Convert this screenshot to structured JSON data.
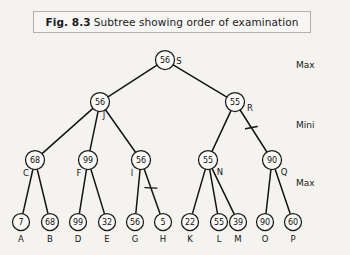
{
  "figure": {
    "number": "Fig. 8.3",
    "caption": "Subtree showing order of examination",
    "border_color": "#b3b0ab",
    "background_color": "#f4f3f0"
  },
  "level_labels": [
    {
      "text": "Max",
      "x": 296,
      "y": 68
    },
    {
      "text": "Mini",
      "x": 296,
      "y": 128
    },
    {
      "text": "Max",
      "x": 296,
      "y": 186
    }
  ],
  "chart_data": {
    "type": "diagram",
    "levels": [
      "Max",
      "Mini",
      "Max",
      "Leaves"
    ],
    "nodes": [
      {
        "id": "S",
        "value": "56",
        "tag": "S",
        "level": 0,
        "x": 165,
        "y": 60,
        "tag_dx": 14,
        "tag_dy": 4
      },
      {
        "id": "J",
        "value": "56",
        "tag": "J",
        "level": 1,
        "x": 100,
        "y": 102,
        "tag_dx": 4,
        "tag_dy": 16
      },
      {
        "id": "R",
        "value": "55",
        "tag": "R",
        "level": 1,
        "x": 235,
        "y": 102,
        "tag_dx": 15,
        "tag_dy": 9
      },
      {
        "id": "C",
        "value": "68",
        "tag": "C",
        "level": 2,
        "x": 35,
        "y": 160,
        "tag_dx": -9,
        "tag_dy": 16
      },
      {
        "id": "F",
        "value": "99",
        "tag": "F",
        "level": 2,
        "x": 88,
        "y": 160,
        "tag_dx": -9,
        "tag_dy": 16
      },
      {
        "id": "I",
        "value": "56",
        "tag": "I",
        "level": 2,
        "x": 141,
        "y": 160,
        "tag_dx": -9,
        "tag_dy": 16
      },
      {
        "id": "N",
        "value": "55",
        "tag": "N",
        "level": 2,
        "x": 208,
        "y": 160,
        "tag_dx": 12,
        "tag_dy": 15
      },
      {
        "id": "Q",
        "value": "90",
        "tag": "Q",
        "level": 2,
        "x": 272,
        "y": 160,
        "tag_dx": 12,
        "tag_dy": 15
      },
      {
        "id": "A",
        "value": "7",
        "tag": "A",
        "level": 3,
        "x": 21,
        "y": 222,
        "tag_dx": 0,
        "tag_dy": 20
      },
      {
        "id": "B",
        "value": "68",
        "tag": "B",
        "level": 3,
        "x": 50,
        "y": 222,
        "tag_dx": 0,
        "tag_dy": 20
      },
      {
        "id": "D",
        "value": "99",
        "tag": "D",
        "level": 3,
        "x": 78,
        "y": 222,
        "tag_dx": 0,
        "tag_dy": 20
      },
      {
        "id": "E",
        "value": "32",
        "tag": "E",
        "level": 3,
        "x": 107,
        "y": 222,
        "tag_dx": 0,
        "tag_dy": 20
      },
      {
        "id": "G",
        "value": "56",
        "tag": "G",
        "level": 3,
        "x": 135,
        "y": 222,
        "tag_dx": 0,
        "tag_dy": 20
      },
      {
        "id": "H",
        "value": "5",
        "tag": "H",
        "level": 3,
        "x": 163,
        "y": 222,
        "tag_dx": 0,
        "tag_dy": 20
      },
      {
        "id": "K",
        "value": "22",
        "tag": "K",
        "level": 3,
        "x": 190,
        "y": 222,
        "tag_dx": 0,
        "tag_dy": 20
      },
      {
        "id": "L",
        "value": "55",
        "tag": "L",
        "level": 3,
        "x": 219,
        "y": 222,
        "tag_dx": 0,
        "tag_dy": 20
      },
      {
        "id": "M",
        "value": "39",
        "tag": "M",
        "level": 3,
        "x": 238,
        "y": 222,
        "tag_dx": 0,
        "tag_dy": 20
      },
      {
        "id": "O",
        "value": "90",
        "tag": "O",
        "level": 3,
        "x": 265,
        "y": 222,
        "tag_dx": 0,
        "tag_dy": 20
      },
      {
        "id": "P",
        "value": "60",
        "tag": "P",
        "level": 3,
        "x": 293,
        "y": 222,
        "tag_dx": 0,
        "tag_dy": 20
      }
    ],
    "edges": [
      {
        "from": "S",
        "to": "J",
        "cut": false
      },
      {
        "from": "S",
        "to": "R",
        "cut": false
      },
      {
        "from": "J",
        "to": "C",
        "cut": false
      },
      {
        "from": "J",
        "to": "F",
        "cut": false
      },
      {
        "from": "J",
        "to": "I",
        "cut": false
      },
      {
        "from": "R",
        "to": "N",
        "cut": false
      },
      {
        "from": "R",
        "to": "Q",
        "cut": true
      },
      {
        "from": "C",
        "to": "A",
        "cut": false
      },
      {
        "from": "C",
        "to": "B",
        "cut": false
      },
      {
        "from": "F",
        "to": "D",
        "cut": false
      },
      {
        "from": "F",
        "to": "E",
        "cut": false
      },
      {
        "from": "I",
        "to": "G",
        "cut": false
      },
      {
        "from": "I",
        "to": "H",
        "cut": true
      },
      {
        "from": "N",
        "to": "K",
        "cut": false
      },
      {
        "from": "N",
        "to": "L",
        "cut": false
      },
      {
        "from": "N",
        "to": "M",
        "cut": false
      },
      {
        "from": "Q",
        "to": "O",
        "cut": false
      },
      {
        "from": "Q",
        "to": "P",
        "cut": false
      }
    ],
    "node_radius": {
      "internal": 9.5,
      "leaf": 8.5
    }
  }
}
